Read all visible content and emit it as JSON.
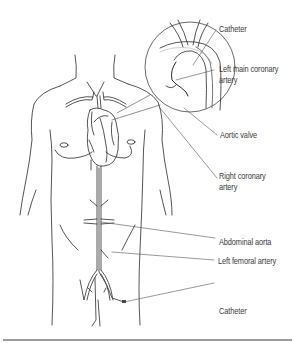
{
  "diagram": {
    "labels": [
      {
        "id": "catheter-top",
        "text": "Catheter"
      },
      {
        "id": "left-main-coronary-artery",
        "text": "Left main coronary\nartery",
        "line1": "Left main coronary",
        "line2": "artery"
      },
      {
        "id": "aortic-valve",
        "text": "Aortic valve"
      },
      {
        "id": "right-coronary-artery",
        "text": "Right coronary\nartery",
        "line1": "Right coronary",
        "line2": "artery"
      },
      {
        "id": "abdominal-aorta",
        "text": "Abdominal aorta"
      },
      {
        "id": "left-femoral-artery",
        "text": "Left femoral artery"
      },
      {
        "id": "catheter-bottom",
        "text": "Catheter"
      }
    ],
    "colors": {
      "line": "#2a2a2a",
      "leader": "#555555",
      "text": "#3a3a3a",
      "rule": "#9a9a9a",
      "background": "#ffffff"
    }
  }
}
